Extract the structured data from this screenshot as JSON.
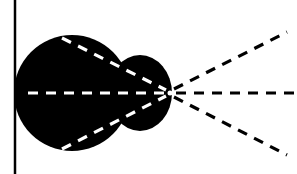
{
  "diagram": {
    "colors": {
      "background": "#ffffff",
      "ink": "#000000",
      "inner_dash": "#ffffff"
    },
    "boundary_line": {
      "x": 15,
      "y1": 0,
      "y2": 174
    },
    "body": {
      "main_circle": {
        "cx": 72,
        "cy": 93,
        "r": 58
      },
      "lobe": {
        "cx": 140,
        "cy": 93,
        "rx": 32,
        "ry": 38
      }
    },
    "focal_point": {
      "x": 170,
      "y": 93
    },
    "inner_rays": [
      {
        "x1": 62,
        "y1": 38,
        "x2": 166,
        "y2": 90
      },
      {
        "x1": 28,
        "y1": 93,
        "x2": 166,
        "y2": 93
      },
      {
        "x1": 62,
        "y1": 149,
        "x2": 166,
        "y2": 96
      }
    ],
    "outer_rays": [
      {
        "x1": 174,
        "y1": 89,
        "x2": 287,
        "y2": 32
      },
      {
        "x1": 176,
        "y1": 93,
        "x2": 297,
        "y2": 93
      },
      {
        "x1": 174,
        "y1": 97,
        "x2": 287,
        "y2": 155
      }
    ]
  }
}
